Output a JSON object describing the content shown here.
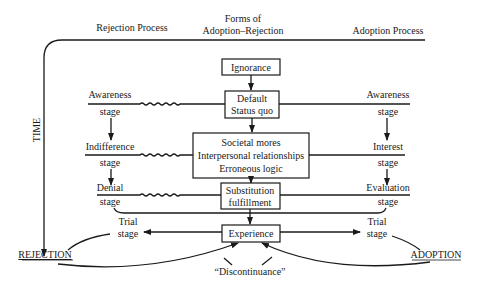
{
  "header": {
    "left": "Rejection Process",
    "center_line1": "Forms of",
    "center_line2": "Adoption–Rejection",
    "right": "Adoption Process"
  },
  "axis": {
    "time_label": "TIME"
  },
  "center_boxes": {
    "ignorance": "Ignorance",
    "default_line1": "Default",
    "default_line2": "Status quo",
    "forms_line1": "Societal mores",
    "forms_line2": "Interpersonal relationships",
    "forms_line3": "Erroneous logic",
    "substitution_line1": "Substitution",
    "substitution_line2": "fulfillment",
    "experience": "Experience"
  },
  "rejection_stages": [
    {
      "name": "Awareness",
      "suffix": "stage"
    },
    {
      "name": "Indifference",
      "suffix": "stage"
    },
    {
      "name": "Denial",
      "suffix": "stage"
    },
    {
      "name": "Trial",
      "suffix": "stage"
    }
  ],
  "adoption_stages": [
    {
      "name": "Awareness",
      "suffix": "stage"
    },
    {
      "name": "Interest",
      "suffix": "stage"
    },
    {
      "name": "Evaluation",
      "suffix": "stage"
    },
    {
      "name": "Trial",
      "suffix": "stage"
    }
  ],
  "outcomes": {
    "rejection": "REJECTION",
    "adoption": "ADOPTION",
    "discontinuance": "“Discontinuance”"
  }
}
